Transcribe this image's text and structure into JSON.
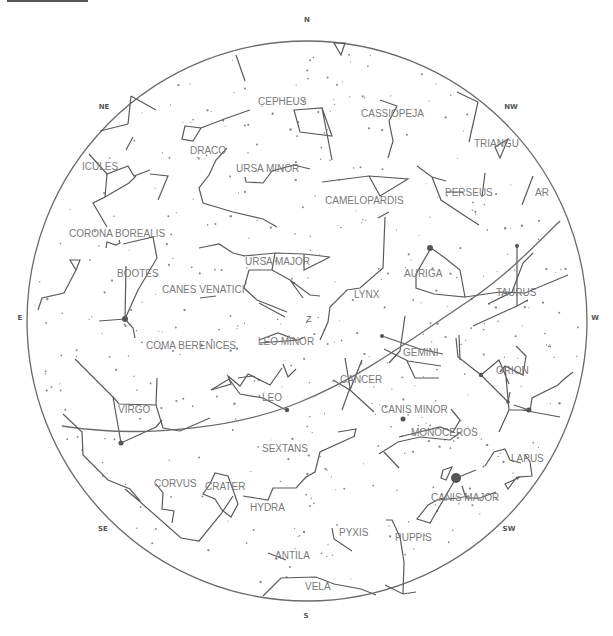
{
  "chart": {
    "title_bar": "",
    "horizon": {
      "cx": 307,
      "cy": 321,
      "r": 280
    },
    "zenith_label": "Z",
    "zenith": {
      "x": 306,
      "y": 322
    },
    "colors": {
      "lines": "#5a5a5a",
      "labels": "#7a7a7a",
      "compass": "#555555",
      "background": "#ffffff"
    },
    "compass": [
      {
        "label": "N",
        "x": 307,
        "y": 22
      },
      {
        "label": "NE",
        "x": 104,
        "y": 109
      },
      {
        "label": "NW",
        "x": 511,
        "y": 109
      },
      {
        "label": "E",
        "x": 20,
        "y": 320
      },
      {
        "label": "W",
        "x": 595,
        "y": 320
      },
      {
        "label": "SE",
        "x": 103,
        "y": 531
      },
      {
        "label": "SW",
        "x": 509,
        "y": 531
      },
      {
        "label": "S",
        "x": 306,
        "y": 618
      }
    ],
    "constellations": [
      {
        "name": "CEPHEUS",
        "x": 258,
        "y": 105
      },
      {
        "name": "CASSIOPEJA",
        "x": 361,
        "y": 117
      },
      {
        "name": "TRIANGU",
        "x": 474,
        "y": 147
      },
      {
        "name": "DRACO",
        "x": 190,
        "y": 154
      },
      {
        "name": "URSA MINOR",
        "x": 236,
        "y": 172
      },
      {
        "name": "ICULES",
        "x": 82,
        "y": 170
      },
      {
        "name": "CAMELOPARDIS",
        "x": 325,
        "y": 204
      },
      {
        "name": "PERSEUS",
        "x": 445,
        "y": 196
      },
      {
        "name": "AR",
        "x": 535,
        "y": 196
      },
      {
        "name": "CORONA BOREALIS",
        "x": 69,
        "y": 237
      },
      {
        "name": "URSA MAJOR",
        "x": 245,
        "y": 265
      },
      {
        "name": "AURIGA",
        "x": 404,
        "y": 277
      },
      {
        "name": "BOOTES",
        "x": 117,
        "y": 277
      },
      {
        "name": "CANES VENATICI",
        "x": 162,
        "y": 293
      },
      {
        "name": "TAURUS",
        "x": 496,
        "y": 296
      },
      {
        "name": "LYNX",
        "x": 354,
        "y": 298
      },
      {
        "name": "COMA BERENICES",
        "x": 146,
        "y": 349
      },
      {
        "name": "LEO MINOR",
        "x": 258,
        "y": 345
      },
      {
        "name": "GEMINI",
        "x": 403,
        "y": 356
      },
      {
        "name": "ORION",
        "x": 496,
        "y": 374
      },
      {
        "name": "CANCER",
        "x": 340,
        "y": 383
      },
      {
        "name": "LEO",
        "x": 262,
        "y": 401
      },
      {
        "name": "CANIS MINOR",
        "x": 381,
        "y": 413
      },
      {
        "name": "VIRGO",
        "x": 118,
        "y": 413
      },
      {
        "name": "MONOCEROS",
        "x": 411,
        "y": 436
      },
      {
        "name": "SEXTANS",
        "x": 262,
        "y": 452
      },
      {
        "name": "LAPUS",
        "x": 511,
        "y": 462
      },
      {
        "name": "CORVUS",
        "x": 154,
        "y": 487
      },
      {
        "name": "CRATER",
        "x": 205,
        "y": 490
      },
      {
        "name": "CANIS MAJOR",
        "x": 431,
        "y": 501
      },
      {
        "name": "HYDRA",
        "x": 250,
        "y": 511
      },
      {
        "name": "PYXIS",
        "x": 339,
        "y": 536
      },
      {
        "name": "PUPPIS",
        "x": 395,
        "y": 541
      },
      {
        "name": "ANTILA",
        "x": 275,
        "y": 559
      },
      {
        "name": "VELA",
        "x": 305,
        "y": 590
      }
    ],
    "lines": [
      "M 236 55 L 245 81",
      "M 334 43 L 345 43 L 341 55 Z",
      "M 294 110 L 322 108 L 332 136 L 300 132 Z M 322 108 L 332 160",
      "M 380 100 L 397 106 L 389 121 L 393 141 L 388 158",
      "M 457 92 L 478 102 L 469 142",
      "M 495 147 L 508 139 L 500 158 Z",
      "M 533 176 L 522 205",
      "M 131 96 L 156 110 M 128 124 L 131 96",
      "M 185 126 L 201 128 L 193 141 L 182 139 Z",
      "M 201 128 L 227 118 L 250 110",
      "M 227 148 L 216 160 L 209 175 L 199 188 L 203 203 L 233 212 L 263 219 L 277 227",
      "M 245 177 L 246 182 L 263 183 L 272 171 L 294 165 L 310 169",
      "M 322 182 L 369 176 L 408 179 L 380 196 L 369 176",
      "M 417 166 L 432 177 L 446 181 M 432 177 L 441 200 L 465 216 L 479 225",
      "M 485 173 L 482 197 M 463 192 L 446 192",
      "M 533 253 L 523 263 L 512 292 L 488 304",
      "M 100 131 L 128 124 M 126 150 L 133 137",
      "M 89 154 L 107 174 L 128 166 L 134 176 L 150 170",
      "M 107 174 L 105 197 L 93 203 L 107 227 M 105 197 L 129 183 L 136 176",
      "M 150 174 L 168 176 L 158 200",
      "M 106 248 L 107 242 L 116 245 L 120 243 L 119 240",
      "M 70 260 L 80 260 L 76 270 Z M 76 270 L 64 293 L 42 298 L 38 310",
      "M 123 244 L 153 237 L 157 258 L 138 290 M 126 266 L 125 319 L 138 290 M 99 321 L 125 319 L 133 328 L 135 338",
      "M 200 298 L 216 296",
      "M 199 248 L 219 244 L 233 253 L 245 256 M 243 256 L 276 253 L 304 254 L 330 257 M 249 270 L 272 270 L 275 253 M 272 270 L 290 280 L 310 295 L 320 296 M 304 254 L 304 270 L 330 257 M 290 280 L 303 298 M 249 270 L 244 288 L 257 300 L 287 312 M 259 303 L 285 317",
      "M 378 218 L 389 212 M 385 217 L 383 268 L 360 288 L 347 290 L 330 307 L 328 322 L 320 340",
      "M 259 340 L 278 333 L 297 340 M 260 343 L 298 340 L 305 337",
      "M 431 248 L 445 258 L 460 270 L 465 297 L 434 294 L 416 288 L 416 274 L 431 248",
      "M 465 297 L 500 292 L 525 293 L 568 275",
      "M 517 246 L 517 306",
      "M 473 326 L 517 306 L 528 300",
      "M 382 336 L 420 349 L 443 354 M 405 316 L 400 351 L 389 363 M 384 349 L 408 361 L 441 366 M 407 361 L 415 378 L 439 378",
      "M 456 338 L 458 357 L 481 375 L 508 402 L 510 392 M 459 335 L 460 360",
      "M 500 372 L 505 366 L 523 375 L 526 356 L 516 346",
      "M 481 375 L 499 360 L 509 384 M 505 366 L 509 410 L 529 410 L 514 405 M 509 410 L 499 432 M 522 410 L 560 417",
      "M 530 411 L 532 398 L 558 385 L 563 380 L 573 372",
      "M 345 358 L 350 388 L 342 410 M 333 380 L 350 390 L 374 412 M 350 390 L 362 360",
      "M 63 414 L 82 432 L 83 455 L 108 480 L 130 489 L 140 501 M 75 359 L 113 397 L 121 443 L 156 427 L 162 420",
      "M 113 397 L 119 404 L 156 405 L 163 428 L 180 431 L 210 418",
      "M 156 405 L 157 378",
      "M 211 390 L 229 379 L 240 394 L 263 398",
      "M 211 390 L 231 384 L 228 376 L 240 386 L 248 374 L 255 377",
      "M 263 398 L 286 410",
      "M 283 364 L 288 377 L 290 375 L 296 369",
      "M 238 378 L 252 376 L 270 385 L 282 368",
      "M 338 432 L 356 429 L 354 437 M 355 436 L 320 452 L 315 472 L 306 477 L 296 488 L 273 488 L 268 500 L 243 496",
      "M 399 437 L 440 427 L 453 432 L 460 420 L 451 409",
      "M 379 454 L 398 442 L 420 437 L 450 440 L 461 432",
      "M 384 452 L 399 468",
      "M 485 466 L 494 452 L 505 449 L 510 460 L 521 463",
      "M 525 455 L 530 462 L 532 476 L 520 477 L 505 484 L 508 489 L 517 477 L 532 476",
      "M 443 470 L 452 467 L 446 480 L 441 478 Z M 456 478 L 476 470 M 462 486 L 466 498 M 456 478 L 430 523 L 417 519 L 428 505 L 437 500 L 458 498 L 469 496",
      "M 466 498 L 480 498 L 496 492",
      "M 156 484 L 163 493 L 162 509 L 174 511 L 172 523",
      "M 210 484 L 215 473 L 228 476 L 232 487 L 238 504 L 231 517 L 222 510 L 215 499 L 203 494 L 210 484",
      "M 125 489 L 138 500 L 181 538 L 199 541 L 221 514 L 233 496",
      "M 386 520 L 392 520 L 400 537 L 404 562 L 403 594",
      "M 332 528 L 334 539 L 352 551",
      "M 268 553 L 286 560",
      "M 263 596 L 281 578 L 316 577 L 334 584 L 361 589 L 376 595",
      "M 385 585 L 403 594 L 416 592"
    ],
    "ecliptic": "M 62 426 C 150 440 245 425 300 402 C 360 378 410 340 470 300 C 510 273 540 240 560 221",
    "bright_stars": [
      {
        "x": 125,
        "y": 319,
        "r": 3
      },
      {
        "x": 121,
        "y": 443,
        "r": 2.5
      },
      {
        "x": 430,
        "y": 248,
        "r": 3
      },
      {
        "x": 456,
        "y": 478,
        "r": 5
      },
      {
        "x": 403,
        "y": 419,
        "r": 2.5
      },
      {
        "x": 481,
        "y": 375,
        "r": 2.2
      },
      {
        "x": 529,
        "y": 410,
        "r": 2.5
      },
      {
        "x": 287,
        "y": 410,
        "r": 2.2
      },
      {
        "x": 382,
        "y": 336,
        "r": 2
      },
      {
        "x": 508,
        "y": 402,
        "r": 1.8
      },
      {
        "x": 517,
        "y": 246,
        "r": 2
      }
    ]
  }
}
